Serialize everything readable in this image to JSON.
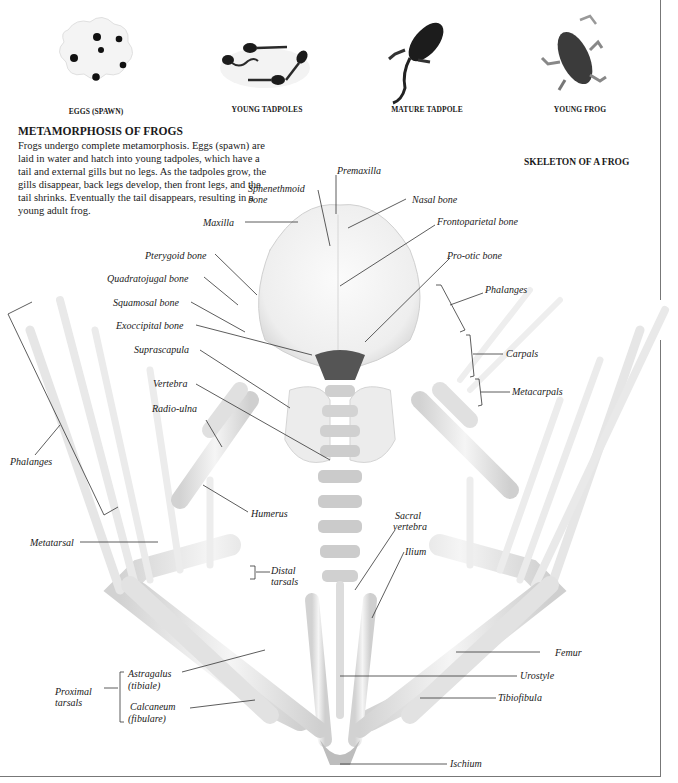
{
  "stages": [
    {
      "label": "EGGS (SPAWN)",
      "icon": "eggs-spawn-icon"
    },
    {
      "label": "YOUNG TADPOLES",
      "icon": "young-tadpoles-icon"
    },
    {
      "label": "MATURE TADPOLE",
      "icon": "mature-tadpole-icon"
    },
    {
      "label": "YOUNG FROG",
      "icon": "young-frog-icon"
    }
  ],
  "intro": {
    "title": "METAMORPHOSIS OF FROGS",
    "text": "Frogs undergo complete metamorphosis. Eggs (spawn) are laid in water and hatch into young tadpoles, which have a tail and external gills but no legs. As the tadpoles grow, the gills disappear, back legs develop, then front legs, and the tail shrinks. Eventually the tail disappears, resulting in a young adult frog."
  },
  "skeleton": {
    "title": "SKELETON OF A FROG",
    "labels": {
      "premaxilla": "Premaxilla",
      "sphenethmoid": "Sphenethmoid bone",
      "sphenethmoid_1": "Sphenethmoid",
      "sphenethmoid_2": "bone",
      "nasal": "Nasal bone",
      "maxilla": "Maxilla",
      "frontoparietal": "Frontoparietal bone",
      "pterygoid": "Pterygoid bone",
      "prootic": "Pro-otic bone",
      "quadratojugal": "Quadratojugal bone",
      "phalanges_fore": "Phalanges",
      "squamosal": "Squamosal bone",
      "exoccipital": "Exoccipital bone",
      "carpals": "Carpals",
      "suprascapula": "Suprascapula",
      "metacarpals": "Metacarpals",
      "vertebra": "Vertebra",
      "radio_ulna": "Radio-ulna",
      "phalanges_hind": "Phalanges",
      "humerus": "Humerus",
      "sacral_1": "Sacral",
      "sacral_2": "vertebra",
      "metatarsal": "Metatarsal",
      "ilium": "Ilium",
      "distal_1": "Distal",
      "distal_2": "tarsals",
      "femur": "Femur",
      "astragalus_1": "Astragalus",
      "astragalus_2": "(tibiale)",
      "urostyle": "Urostyle",
      "proximal_1": "Proximal",
      "proximal_2": "tarsals",
      "tibiofibula": "Tibiofibula",
      "calcaneum_1": "Calcaneum",
      "calcaneum_2": "(fibulare)",
      "ischium": "Ischium"
    }
  },
  "colors": {
    "text": "#1a1a1a",
    "leader": "#333333",
    "bone": "#e9e9e9",
    "bone_shadow": "#bdbdbd",
    "frame": "#777777"
  }
}
